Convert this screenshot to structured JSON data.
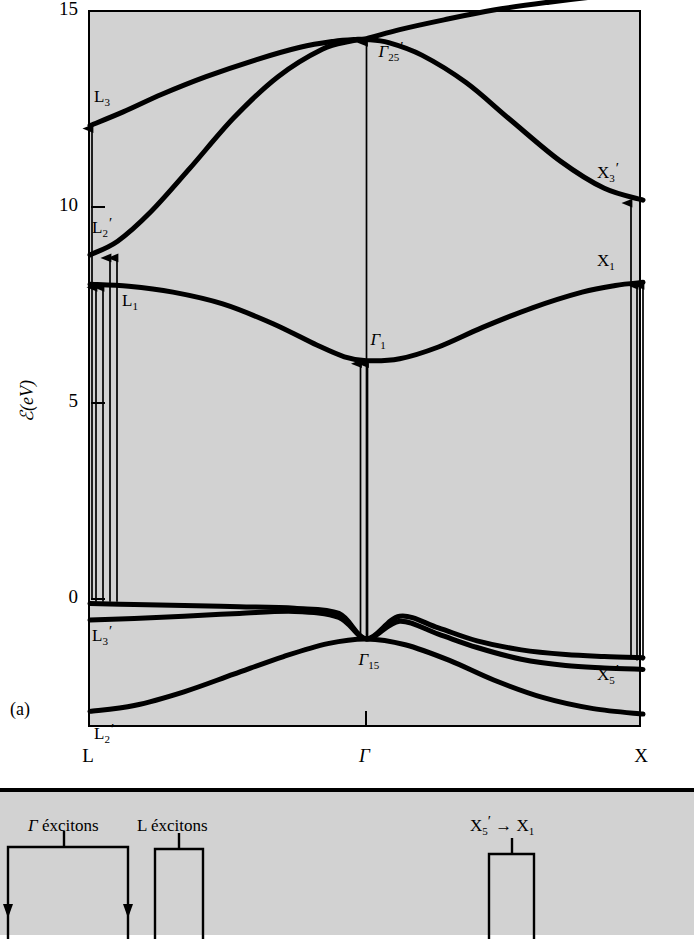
{
  "figure": {
    "panel_a_label": "(a)",
    "y_axis_label": "ℰ(eV)"
  },
  "chart_data": {
    "type": "line",
    "xlabel": "",
    "ylabel": "ℰ(eV)",
    "x_tick_labels": [
      "L",
      "Γ",
      "X"
    ],
    "x_tick_positions": [
      0.0,
      0.5,
      1.0
    ],
    "y_tick_labels": [
      "15",
      "10",
      "5",
      "0"
    ],
    "y_ticks": [
      15,
      10,
      5,
      0
    ],
    "ylim": [
      -3.3,
      15.0
    ],
    "xlim": [
      0,
      1
    ],
    "grid": false,
    "legend": "none",
    "series": [
      {
        "name": "upper-conduction-band",
        "comment": "L3 → Γ25' → X3'",
        "x": [
          0.0,
          0.06,
          0.13,
          0.21,
          0.3,
          0.38,
          0.44,
          0.48,
          0.5,
          0.54,
          0.6,
          0.68,
          0.76,
          0.85,
          0.93,
          1.0
        ],
        "y": [
          12.1,
          12.45,
          12.9,
          13.35,
          13.78,
          14.1,
          14.25,
          14.3,
          14.3,
          14.22,
          13.9,
          13.2,
          12.25,
          11.2,
          10.5,
          10.2
        ]
      },
      {
        "name": "second-conduction-band",
        "comment": "L2' → Γ25' → top-right",
        "x": [
          0.0,
          0.05,
          0.11,
          0.18,
          0.26,
          0.34,
          0.42,
          0.47,
          0.5,
          0.56,
          0.64,
          0.73,
          0.83,
          0.92,
          1.0
        ],
        "y": [
          8.8,
          9.15,
          9.9,
          11.0,
          12.3,
          13.35,
          14.05,
          14.25,
          14.32,
          14.55,
          14.8,
          15.05,
          15.25,
          15.4,
          15.5
        ]
      },
      {
        "name": "lowest-conduction-band",
        "comment": "L1 → Γ1 → X1",
        "x": [
          0.0,
          0.07,
          0.15,
          0.24,
          0.33,
          0.41,
          0.46,
          0.5,
          0.56,
          0.63,
          0.71,
          0.8,
          0.89,
          0.95,
          1.0
        ],
        "y": [
          8.05,
          8.0,
          7.85,
          7.55,
          7.05,
          6.5,
          6.2,
          6.1,
          6.15,
          6.45,
          6.95,
          7.45,
          7.85,
          8.02,
          8.1
        ]
      },
      {
        "name": "upper-valence-band",
        "comment": "L3' → Γ15 → X5' (upper branch)",
        "x": [
          0.0,
          0.08,
          0.17,
          0.27,
          0.37,
          0.45,
          0.5,
          0.56,
          0.63,
          0.7,
          0.78,
          0.86,
          0.93,
          1.0
        ],
        "y": [
          -0.1,
          -0.12,
          -0.15,
          -0.18,
          -0.22,
          -0.35,
          -1.0,
          -0.42,
          -0.72,
          -1.05,
          -1.28,
          -1.4,
          -1.45,
          -1.48
        ]
      },
      {
        "name": "second-valence-band",
        "comment": "L3' lower branch → Γ15 → X5' (lower branch)",
        "x": [
          0.0,
          0.08,
          0.17,
          0.27,
          0.37,
          0.45,
          0.5,
          0.56,
          0.63,
          0.7,
          0.78,
          0.86,
          0.93,
          1.0
        ],
        "y": [
          -0.52,
          -0.48,
          -0.42,
          -0.35,
          -0.3,
          -0.45,
          -1.0,
          -0.55,
          -0.88,
          -1.22,
          -1.52,
          -1.68,
          -1.74,
          -1.78
        ]
      },
      {
        "name": "lowest-valence-band",
        "comment": "L2' → Γ15 region → X bottom",
        "x": [
          0.0,
          0.08,
          0.17,
          0.26,
          0.35,
          0.43,
          0.5,
          0.57,
          0.65,
          0.73,
          0.82,
          0.91,
          1.0
        ],
        "y": [
          -2.85,
          -2.7,
          -2.35,
          -1.9,
          -1.45,
          -1.12,
          -1.0,
          -1.15,
          -1.55,
          -2.05,
          -2.5,
          -2.78,
          -2.92
        ]
      }
    ],
    "annotations": [
      {
        "name": "L3",
        "text": "L",
        "sub": "3",
        "prime": false,
        "energy": 12.1,
        "k": "L"
      },
      {
        "name": "L2p",
        "text": "L",
        "sub": "2",
        "prime": true,
        "energy": 8.8,
        "k": "L"
      },
      {
        "name": "L1",
        "text": "L",
        "sub": "1",
        "prime": false,
        "energy": 8.05,
        "k": "L"
      },
      {
        "name": "L3p",
        "text": "L",
        "sub": "3",
        "prime": true,
        "energy": -0.4,
        "k": "L"
      },
      {
        "name": "L2pv",
        "text": "L",
        "sub": "2",
        "prime": true,
        "energy": -2.85,
        "k": "L"
      },
      {
        "name": "G25p",
        "text": "Γ",
        "sub": "25",
        "prime": true,
        "energy": 14.3,
        "k": "Γ"
      },
      {
        "name": "G1",
        "text": "Γ",
        "sub": "1",
        "prime": false,
        "energy": 6.1,
        "k": "Γ"
      },
      {
        "name": "G15",
        "text": "Γ",
        "sub": "15",
        "prime": false,
        "energy": -1.0,
        "k": "Γ"
      },
      {
        "name": "X3p",
        "text": "X",
        "sub": "3",
        "prime": true,
        "energy": 10.2,
        "k": "X"
      },
      {
        "name": "X1",
        "text": "X",
        "sub": "1",
        "prime": false,
        "energy": 8.1,
        "k": "X"
      },
      {
        "name": "X5p",
        "text": "X",
        "sub": "5",
        "prime": true,
        "energy": -1.5,
        "k": "X"
      }
    ],
    "transition_arrows": [
      {
        "name": "L-to-L3",
        "k": "L",
        "from": 0.0,
        "to": 12.1
      },
      {
        "name": "L-to-L2p-a",
        "k": "L",
        "from": -0.05,
        "to": 8.8
      },
      {
        "name": "L-to-L2p-b",
        "k": "L",
        "from": -0.05,
        "to": 8.8
      },
      {
        "name": "L-to-L1-a",
        "k": "L",
        "from": -0.05,
        "to": 8.05
      },
      {
        "name": "L-to-L1-b",
        "k": "L",
        "from": -0.05,
        "to": 8.05
      },
      {
        "name": "G-to-G25p",
        "k": "Γ",
        "from": -1.0,
        "to": 14.3
      },
      {
        "name": "G-to-G1-a",
        "k": "Γ",
        "from": -1.0,
        "to": 6.1
      },
      {
        "name": "G-to-G1-b",
        "k": "Γ",
        "from": -1.0,
        "to": 6.1
      },
      {
        "name": "X-to-X3p",
        "k": "X",
        "from": -1.5,
        "to": 10.2
      },
      {
        "name": "X-to-X1-a",
        "k": "X",
        "from": -1.55,
        "to": 8.1
      },
      {
        "name": "X-to-X1-b",
        "k": "X",
        "from": -1.55,
        "to": 8.1
      }
    ]
  },
  "panel_b": {
    "groups": [
      {
        "name": "gamma-excitons",
        "text": "Γ",
        "italic_first": true,
        "rest": " éxcitons"
      },
      {
        "name": "l-excitons",
        "text": "L",
        "italic_first": false,
        "rest": " éxcitons"
      },
      {
        "name": "x5p-to-x1",
        "text": "X",
        "sub": "5",
        "prime": true,
        "arrow": "→",
        "text2": "X",
        "sub2": "1"
      }
    ]
  }
}
